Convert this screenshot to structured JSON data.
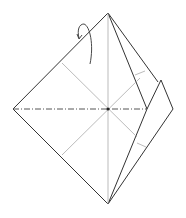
{
  "diagram": {
    "type": "origami-fold-step",
    "background": "#ffffff",
    "line_color": "#333333",
    "crease_color": "#999999",
    "elements": {
      "outline": "square-base diamond with right flap folded",
      "valley_fold_line": "horizontal dash-dot line from left corner to center",
      "arrow": "curved turn-over arrow near top-left edge"
    }
  }
}
